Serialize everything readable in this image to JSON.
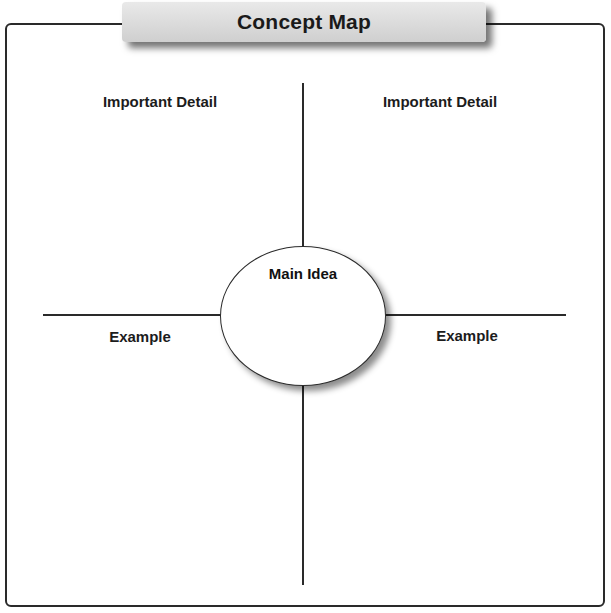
{
  "title": "Concept Map",
  "main_idea": {
    "label": "Main Idea"
  },
  "branches": {
    "top_left": {
      "label": "Important Detail"
    },
    "top_right": {
      "label": "Important Detail"
    },
    "left": {
      "label": "Example"
    },
    "right": {
      "label": "Example"
    }
  },
  "colors": {
    "line": "#2a2a2a",
    "banner_top": "#e9e9e9",
    "banner_bottom": "#cfcfcf",
    "background": "#ffffff"
  }
}
